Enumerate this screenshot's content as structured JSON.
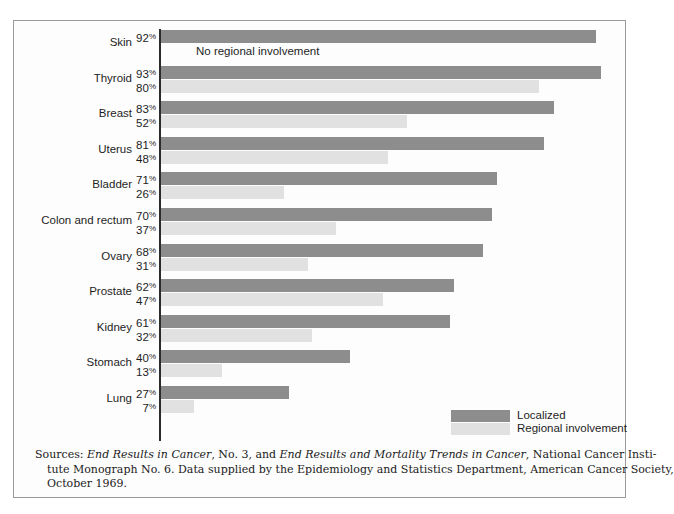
{
  "chart_data": {
    "type": "bar",
    "orientation": "horizontal",
    "title": "",
    "xlabel": "",
    "ylabel": "",
    "xlim": [
      0,
      100
    ],
    "grid": false,
    "legend_position": "bottom-right",
    "categories": [
      "Skin",
      "Thyroid",
      "Breast",
      "Uterus",
      "Bladder",
      "Colon and rectum",
      "Ovary",
      "Prostate",
      "Kidney",
      "Stomach",
      "Lung"
    ],
    "series": [
      {
        "name": "Localized",
        "color": "#8d8d8d",
        "values": [
          92,
          93,
          83,
          81,
          71,
          70,
          68,
          62,
          61,
          40,
          27
        ]
      },
      {
        "name": "Regional involvement",
        "color": "#e1e1e1",
        "values": [
          null,
          80,
          52,
          48,
          26,
          37,
          31,
          47,
          32,
          13,
          7
        ]
      }
    ],
    "annotations": [
      "No regional involvement"
    ]
  },
  "chart": {
    "rows": [
      {
        "label": "Skin",
        "localized": "92",
        "localized_pct": "92%",
        "regional": null,
        "regional_pct": "",
        "annotation": "No regional involvement"
      },
      {
        "label": "Thyroid",
        "localized": "93",
        "localized_pct": "93%",
        "regional": "80",
        "regional_pct": "80%",
        "annotation": null
      },
      {
        "label": "Breast",
        "localized": "83",
        "localized_pct": "83%",
        "regional": "52",
        "regional_pct": "52%",
        "annotation": null
      },
      {
        "label": "Uterus",
        "localized": "81",
        "localized_pct": "81%",
        "regional": "48",
        "regional_pct": "48%",
        "annotation": null
      },
      {
        "label": "Bladder",
        "localized": "71",
        "localized_pct": "71%",
        "regional": "26",
        "regional_pct": "26%",
        "annotation": null
      },
      {
        "label": "Colon and rectum",
        "localized": "70",
        "localized_pct": "70%",
        "regional": "37",
        "regional_pct": "37%",
        "annotation": null
      },
      {
        "label": "Ovary",
        "localized": "68",
        "localized_pct": "68%",
        "regional": "31",
        "regional_pct": "31%",
        "annotation": null
      },
      {
        "label": "Prostate",
        "localized": "62",
        "localized_pct": "62%",
        "regional": "47",
        "regional_pct": "47%",
        "annotation": null
      },
      {
        "label": "Kidney",
        "localized": "61",
        "localized_pct": "61%",
        "regional": "32",
        "regional_pct": "32%",
        "annotation": null
      },
      {
        "label": "Stomach",
        "localized": "40",
        "localized_pct": "40%",
        "regional": "13",
        "regional_pct": "13%",
        "annotation": null
      },
      {
        "label": "Lung",
        "localized": "27",
        "localized_pct": "27%",
        "regional": "7",
        "regional_pct": "7%",
        "annotation": null
      }
    ]
  },
  "legend": {
    "items": [
      {
        "label": "Localized",
        "color": "#8d8d8d"
      },
      {
        "label": "Regional involvement",
        "color": "#e1e1e1"
      }
    ]
  },
  "source_note": {
    "line1_a": "Sources: ",
    "line1_b": "End Results in Cancer",
    "line1_c": ", No. 3, and ",
    "line1_d": "End Results and Mortality Trends in Cancer",
    "line1_e": ", National Cancer Insti-",
    "line2": "tute Monograph No. 6. Data supplied by the Epidemiology and Statistics Department, American Cancer Society,",
    "line3": "October 1969."
  }
}
